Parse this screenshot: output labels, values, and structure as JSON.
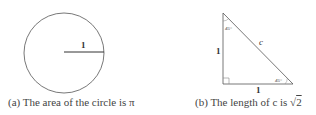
{
  "figure_a": {
    "radius_label": "1",
    "caption": "(a) The area of the circle is π"
  },
  "figure_b": {
    "top_angle_label": "45°",
    "right_angle_label": "45°",
    "hypotenuse_label": "c",
    "vertical_side_label": "1",
    "horizontal_side_label": "1",
    "caption_prefix": "(b) The length of c is ",
    "caption_value": "2"
  }
}
